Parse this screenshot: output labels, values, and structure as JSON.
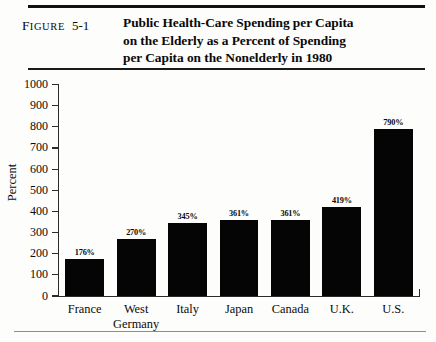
{
  "figure": {
    "label_first": "F",
    "label_rest": "IGURE",
    "number": "5-1",
    "title_line1": "Public Health-Care Spending per Capita",
    "title_line2": "on the Elderly as a Percent of Spending",
    "title_line3": "per Capita on the Nonelderly in 1980"
  },
  "chart_data": {
    "type": "bar",
    "title": "Public Health-Care Spending per Capita on the Elderly as a Percent of Spending per Capita on the Nonelderly in 1980",
    "xlabel": "",
    "ylabel": "Percent",
    "ylim": [
      0,
      1000
    ],
    "yticks": [
      "0",
      "100",
      "200",
      "300",
      "400",
      "500",
      "600",
      "700",
      "800",
      "900",
      "1000"
    ],
    "ytick_values": [
      0,
      100,
      200,
      300,
      400,
      500,
      600,
      700,
      800,
      900,
      1000
    ],
    "grid": false,
    "legend": null,
    "categories": [
      "France",
      "West Germany",
      "Italy",
      "Japan",
      "Canada",
      "U.K.",
      "U.S."
    ],
    "category_lines": [
      [
        "France"
      ],
      [
        "West",
        "Germany"
      ],
      [
        "Italy"
      ],
      [
        "Japan"
      ],
      [
        "Canada"
      ],
      [
        "U.K."
      ],
      [
        "U.S."
      ]
    ],
    "values": [
      176,
      270,
      345,
      361,
      361,
      419,
      790
    ],
    "data_labels": [
      "176%",
      "270%",
      "345%",
      "361%",
      "361%",
      "419%",
      "790%"
    ],
    "bar_color": "#050505"
  }
}
